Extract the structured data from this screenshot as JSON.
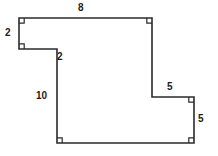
{
  "figure": {
    "kind": "rectilinear-polygon-diagram",
    "stroke_color": "#2b2b2b",
    "fill_color": "#ffffff",
    "background_color": "#ffffff",
    "label_color": "#1c1c1c",
    "stroke_width": 1.6,
    "canvas": {
      "width": 218,
      "height": 156
    },
    "vertices": [
      {
        "name": "top-left",
        "x": 19,
        "y": 18
      },
      {
        "name": "top-right",
        "x": 152,
        "y": 18
      },
      {
        "name": "right-upper-step",
        "x": 152,
        "y": 97
      },
      {
        "name": "right-step-outer",
        "x": 194,
        "y": 97
      },
      {
        "name": "bottom-right",
        "x": 194,
        "y": 143
      },
      {
        "name": "bottom-left",
        "x": 57,
        "y": 143
      },
      {
        "name": "inner-step-top",
        "x": 57,
        "y": 49
      },
      {
        "name": "left-lower",
        "x": 19,
        "y": 49
      }
    ],
    "right_angle_markers": [
      {
        "name": "marker-top-left",
        "x": 19,
        "y": 18,
        "dx": 1,
        "dy": 1
      },
      {
        "name": "marker-top-right",
        "x": 152,
        "y": 18,
        "dx": -1,
        "dy": 1
      },
      {
        "name": "marker-left-lower",
        "x": 19,
        "y": 49,
        "dx": 1,
        "dy": -1
      },
      {
        "name": "marker-step-outer",
        "x": 194,
        "y": 97,
        "dx": -1,
        "dy": 1
      },
      {
        "name": "marker-bottom-left",
        "x": 57,
        "y": 143,
        "dx": 1,
        "dy": -1
      },
      {
        "name": "marker-bottom-right",
        "x": 194,
        "y": 143,
        "dx": -1,
        "dy": -1
      }
    ],
    "side_labels": [
      {
        "name": "label-top",
        "text": "8",
        "x": 78,
        "y": 3,
        "side": "top edge, length 8"
      },
      {
        "name": "label-left-upper",
        "text": "2",
        "x": 5,
        "y": 28,
        "side": "upper-left vertical edge, length 2"
      },
      {
        "name": "label-step-top",
        "text": "2",
        "x": 57,
        "y": 52,
        "side": "inner horizontal step edge, length 2"
      },
      {
        "name": "label-left-long",
        "text": "10",
        "x": 36,
        "y": 91,
        "side": "long left vertical edge, length 10"
      },
      {
        "name": "label-step-right",
        "text": "5",
        "x": 167,
        "y": 82,
        "side": "inner horizontal edge near right step, length 5"
      },
      {
        "name": "label-right-lower",
        "text": "5",
        "x": 198,
        "y": 114,
        "side": "lower-right vertical edge, length 5"
      }
    ]
  }
}
